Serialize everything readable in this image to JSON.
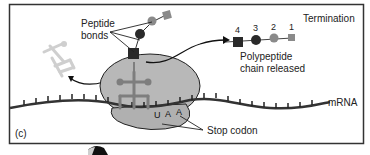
{
  "panel_label": "(c)",
  "stage_title": "Termination",
  "labels": {
    "peptide_bonds_line1": "Peptide",
    "peptide_bonds_line2": "bonds",
    "polypeptide_line1": "Polypeptide",
    "polypeptide_line2": "chain released",
    "mrna": "mRNA",
    "stop_codon": "Stop codon"
  },
  "stop_codon_bases": [
    "U",
    "A",
    "A"
  ],
  "released_chain": {
    "residues": [
      {
        "number": "4",
        "shape": "square",
        "color": "#2a2a2a"
      },
      {
        "number": "3",
        "shape": "circle",
        "color": "#2a2a2a"
      },
      {
        "number": "2",
        "shape": "circle",
        "color": "#8a8a8a"
      },
      {
        "number": "1",
        "shape": "square",
        "color": "#8a8a8a"
      }
    ]
  },
  "colors": {
    "ribosome": "#b8b8b8",
    "trna_bound": "#8c8c8c",
    "trna_released": "#cfcfcf",
    "mrna": "#3a3a3a",
    "frame": "#333333"
  }
}
